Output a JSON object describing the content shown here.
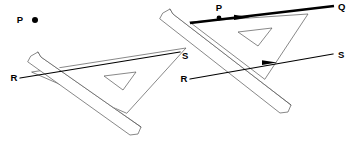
{
  "figure": {
    "background_color": "#ffffff",
    "ink_color": "#000000",
    "tool_outline_color": "#555555",
    "width": 352,
    "height": 141
  },
  "labels": {
    "left_point_p": "P",
    "left_r": "R",
    "left_s": "S",
    "right_p": "P",
    "right_q": "Q",
    "right_r": "R",
    "right_s": "S"
  },
  "stages": [
    {
      "name": "stage-1-left",
      "caption_points": [
        "P",
        "R",
        "S"
      ],
      "description": "Set-square slid along ruler with free point P above line RS"
    },
    {
      "name": "stage-2-right",
      "caption_points": [
        "P",
        "Q",
        "R",
        "S"
      ],
      "description": "Set-square moved up so its edge passes through P; line PQ drawn parallel to RS"
    }
  ],
  "line_segments": [
    {
      "name": "left-line-RS",
      "from": "R",
      "to": "S",
      "weight": "thin",
      "arrow": "none"
    },
    {
      "name": "right-line-RS",
      "from": "R",
      "to": "S",
      "weight": "thin",
      "arrow": "mid-right"
    },
    {
      "name": "right-line-PQ",
      "from": "P",
      "to": "Q",
      "weight": "thick",
      "arrow": "mid-right"
    }
  ],
  "markers": {
    "left_p_dot": "filled-dot",
    "right_p_dot": "filled-dot"
  }
}
